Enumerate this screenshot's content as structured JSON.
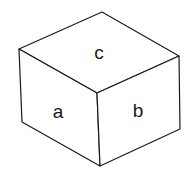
{
  "diagram": {
    "type": "isometric-cube",
    "faces": {
      "top": {
        "label": "c"
      },
      "left": {
        "label": "a"
      },
      "right": {
        "label": "b"
      }
    },
    "colors": {
      "stroke": "#1a1a1a",
      "background": "#ffffff"
    }
  }
}
